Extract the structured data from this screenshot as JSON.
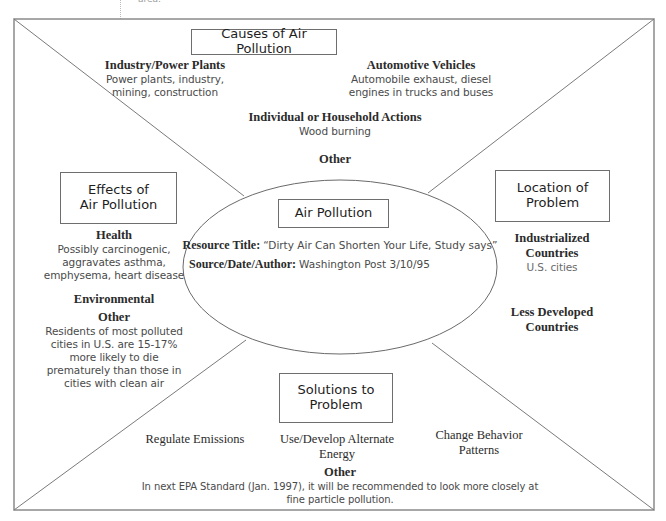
{
  "header_fragment": "area.",
  "center": {
    "title": "Air Pollution",
    "resource_title_label": "Resource Title:",
    "resource_title_value": "“Dirty Air Can Shorten Your Life, Study says”",
    "source_label": "Source/Date/Author:",
    "source_value": "Washington Post 3/10/95"
  },
  "causes": {
    "title": "Causes of Air Pollution",
    "items": [
      {
        "heading": "Industry/Power Plants",
        "detail_lines": [
          "Power plants, industry,",
          "mining, construction"
        ]
      },
      {
        "heading": "Automotive Vehicles",
        "detail_lines": [
          "Automobile exhaust, diesel",
          "engines in trucks and buses"
        ]
      },
      {
        "heading": "Individual or Household Actions",
        "detail_lines": [
          "Wood burning"
        ]
      },
      {
        "heading": "Other",
        "detail_lines": []
      }
    ]
  },
  "effects": {
    "title_lines": [
      "Effects of",
      "Air Pollution"
    ],
    "items": [
      {
        "heading": "Health",
        "detail_lines": [
          "Possibly carcinogenic,",
          "aggravates asthma,",
          "emphysema, heart disease"
        ]
      },
      {
        "heading": "Environmental",
        "detail_lines": []
      },
      {
        "heading": "Other",
        "detail_lines": [
          "Residents of most polluted",
          "cities in U.S. are 15-17%",
          "more likely to die",
          "prematurely than those in",
          "cities with clean air"
        ]
      }
    ]
  },
  "location": {
    "title_lines": [
      "Location of",
      "Problem"
    ],
    "items": [
      {
        "heading_lines": [
          "Industrialized",
          "Countries"
        ],
        "detail_lines": [
          "U.S. cities"
        ]
      },
      {
        "heading_lines": [
          "Less Developed",
          "Countries"
        ],
        "detail_lines": []
      }
    ]
  },
  "solutions": {
    "title_lines": [
      "Solutions to",
      "Problem"
    ],
    "items": [
      {
        "heading_lines": [
          "Regulate Emissions"
        ]
      },
      {
        "heading_lines": [
          "Use/Develop Alternate",
          "Energy"
        ]
      },
      {
        "heading_lines": [
          "Change Behavior",
          "Patterns"
        ]
      }
    ],
    "other": {
      "heading": "Other",
      "detail_lines": [
        "In next EPA Standard (Jan. 1997), it will be recommended to look more closely at",
        "fine particle pollution."
      ]
    }
  },
  "colors": {
    "frame": "#8a8a8a",
    "text_heading": "#2b2b2b",
    "text_detail": "#4a4a4a"
  }
}
